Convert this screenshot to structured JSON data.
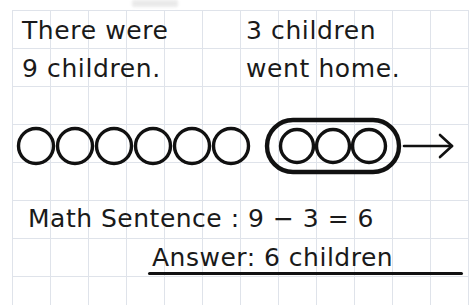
{
  "worksheet": {
    "story": {
      "left_line_1": "There were",
      "left_line_2": "9 children.",
      "right_line_1": "3 children",
      "right_line_2": "went home."
    },
    "diagram": {
      "ungrouped_circle_count": 6,
      "grouped_circle_count": 3,
      "group_marker": "lasso-rounded-rectangle",
      "arrow_direction": "right",
      "arrow_glyph": "→",
      "total_circles": 9
    },
    "math_sentence": {
      "label": "Math Sentence :",
      "minuend": "9",
      "operator": "−",
      "subtrahend": "3",
      "equals": "=",
      "difference": "6",
      "full_text": "Math Sentence : 9 − 3 = 6"
    },
    "answer": {
      "label": "Answer:",
      "value": "6",
      "unit": "children",
      "full_text": "Answer: 6 children"
    },
    "colors": {
      "ink": "#1a1a1a",
      "grid_line": "#dfe3ea",
      "paper": "#ffffff"
    }
  }
}
